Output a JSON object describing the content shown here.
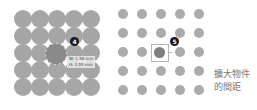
{
  "left_panel": {
    "grid": {
      "rows": 5,
      "cols": 5,
      "dot_color": "#a6a6a6"
    },
    "badge": "4",
    "measurements": {
      "width": "W: 1.58 mm",
      "height": "H: 1.55 mm"
    }
  },
  "right_panel": {
    "grid": {
      "rows": 5,
      "cols": 5,
      "dot_color": "#ababab"
    },
    "badge": "5",
    "caption_line1": "擴大物件",
    "caption_line2": "的間距"
  }
}
